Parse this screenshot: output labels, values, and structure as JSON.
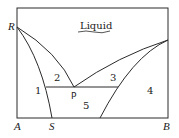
{
  "diagram": {
    "type": "phase-diagram",
    "labels": {
      "liquid": "Liquid",
      "R": "R",
      "A": "A",
      "S": "S",
      "B": "B",
      "P": "P",
      "region1": "1",
      "region2": "2",
      "region3": "3",
      "region4": "4",
      "region5": "5"
    },
    "colors": {
      "line": "#2a2a2a",
      "background": "#ffffff"
    }
  }
}
